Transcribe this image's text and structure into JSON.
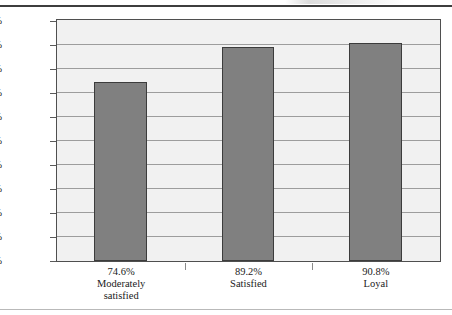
{
  "figure": {
    "name": "customer-satisfaction-loyalty-bar-chart",
    "background_color": "#ffffff",
    "plot_background_color": "#f1f1f1",
    "gridline_color": "#9d9d9d",
    "axis_color": "#4f4f4f",
    "bar_fill_color": "#808080",
    "bar_border_color": "#3c3c3c",
    "rule_top_color": "#3d3d3d",
    "rule_bottom_color": "#b9b9b9"
  },
  "chart_data": {
    "type": "bar",
    "title": "",
    "subtitle": "",
    "xlabel": "",
    "ylabel": "",
    "categories": [
      "Moderately satisfied",
      "Satisfied",
      "Loyal"
    ],
    "category_lines": [
      [
        "Moderately",
        "satisfied"
      ],
      [
        "Satisfied"
      ],
      [
        "Loyal"
      ]
    ],
    "values": [
      74.6,
      89.2,
      90.8
    ],
    "value_labels": [
      "74.6%",
      "89.2%",
      "90.8%"
    ],
    "ylim": [
      0,
      100
    ],
    "ytick_values": [
      0,
      10,
      20,
      30,
      40,
      50,
      60,
      70,
      80,
      90,
      100
    ],
    "ytick_labels": [
      "0.0%",
      "10.0%",
      "20.0%",
      "30.0%",
      "40.0%",
      "50.0%",
      "60.0%",
      "70.0%",
      "80.0%",
      "90.0%",
      "100.0%"
    ],
    "grid": true,
    "grid_axis": "y",
    "legend": false,
    "legend_position": "none",
    "series": [
      {
        "name": "",
        "values": [
          74.6,
          89.2,
          90.8
        ]
      }
    ]
  }
}
